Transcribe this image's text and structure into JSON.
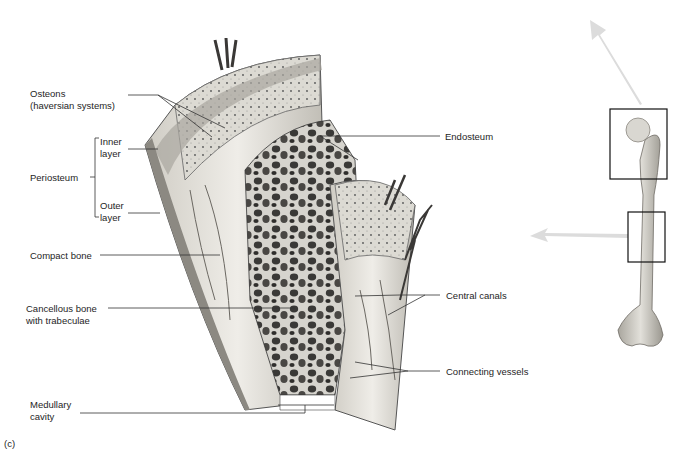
{
  "figure": {
    "panel_letter": "(c)",
    "labels": {
      "osteons": "Osteons\n(haversian systems)",
      "periosteum": "Periosteum",
      "inner_layer": "Inner\nlayer",
      "outer_layer": "Outer\nlayer",
      "compact_bone": "Compact bone",
      "cancellous_bone": "Cancellous bone\nwith trabeculae",
      "medullary_cavity": "Medullary\ncavity",
      "endosteum": "Endosteum",
      "central_canals": "Central canals",
      "connecting_vessels": "Connecting vessels"
    },
    "colors": {
      "bone_light": "#e4e2dc",
      "bone_mid": "#b9b6ae",
      "bone_dark": "#4a4845",
      "arrow": "#dcdcdc",
      "leader_line": "#333333"
    }
  }
}
